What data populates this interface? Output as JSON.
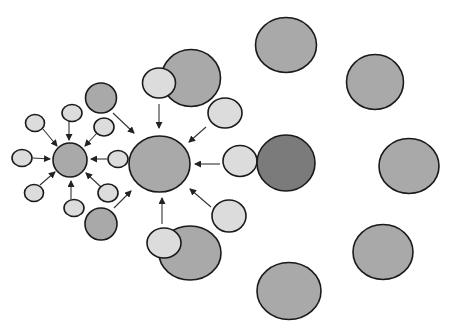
{
  "colors": {
    "light": "#dcdcdc",
    "medium": "#a9a9a9",
    "dark": "#7b7b7b",
    "stroke": "#1a1a1a",
    "arrow": "#333333"
  },
  "nodes": [
    {
      "id": "hub-small",
      "cx": 70,
      "cy": 160,
      "rx": 17,
      "ry": 17,
      "fill": "medium"
    },
    {
      "id": "s-left",
      "cx": 22,
      "cy": 158,
      "rx": 10,
      "ry": 8.5,
      "fill": "light"
    },
    {
      "id": "s-topleft",
      "cx": 35,
      "cy": 123,
      "rx": 9.5,
      "ry": 8.5,
      "fill": "light"
    },
    {
      "id": "s-top",
      "cx": 72,
      "cy": 113,
      "rx": 10,
      "ry": 8.5,
      "fill": "light"
    },
    {
      "id": "s-topright",
      "cx": 104,
      "cy": 127,
      "rx": 10,
      "ry": 9,
      "fill": "light"
    },
    {
      "id": "s-right",
      "cx": 118,
      "cy": 159,
      "rx": 10,
      "ry": 8.5,
      "fill": "light"
    },
    {
      "id": "s-botright",
      "cx": 108,
      "cy": 193,
      "rx": 10,
      "ry": 9,
      "fill": "light"
    },
    {
      "id": "s-bot",
      "cx": 74,
      "cy": 208,
      "rx": 10,
      "ry": 8.5,
      "fill": "light"
    },
    {
      "id": "s-botleft",
      "cx": 34,
      "cy": 193,
      "rx": 9.5,
      "ry": 8.5,
      "fill": "light"
    },
    {
      "id": "m-top",
      "cx": 101,
      "cy": 98,
      "rx": 15.5,
      "ry": 15,
      "fill": "medium"
    },
    {
      "id": "m-bot",
      "cx": 101,
      "cy": 224,
      "rx": 16,
      "ry": 16,
      "fill": "medium"
    },
    {
      "id": "hub-main",
      "cx": 159.5,
      "cy": 164,
      "rx": 30.5,
      "ry": 28,
      "fill": "medium"
    },
    {
      "id": "big-top",
      "cx": 191,
      "cy": 78,
      "rx": 29.5,
      "ry": 28.5,
      "fill": "medium"
    },
    {
      "id": "big-top-light",
      "cx": 159,
      "cy": 83,
      "rx": 16.5,
      "ry": 15,
      "fill": "light"
    },
    {
      "id": "l-topright",
      "cx": 225,
      "cy": 113,
      "rx": 17,
      "ry": 15,
      "fill": "light"
    },
    {
      "id": "l-right",
      "cx": 240,
      "cy": 161,
      "rx": 17,
      "ry": 15.5,
      "fill": "light"
    },
    {
      "id": "dark-right",
      "cx": 286,
      "cy": 163,
      "rx": 29,
      "ry": 28,
      "fill": "dark"
    },
    {
      "id": "l-botright",
      "cx": 229,
      "cy": 216,
      "rx": 17,
      "ry": 16,
      "fill": "light"
    },
    {
      "id": "big-bot",
      "cx": 190,
      "cy": 253,
      "rx": 31,
      "ry": 27,
      "fill": "medium"
    },
    {
      "id": "big-bot-light",
      "cx": 164,
      "cy": 243,
      "rx": 17,
      "ry": 15,
      "fill": "light"
    },
    {
      "id": "r-top",
      "cx": 286,
      "cy": 45,
      "rx": 30.5,
      "ry": 27.5,
      "fill": "medium"
    },
    {
      "id": "r-topright",
      "cx": 375,
      "cy": 82,
      "rx": 28.5,
      "ry": 27.5,
      "fill": "medium"
    },
    {
      "id": "r-right",
      "cx": 409,
      "cy": 166,
      "rx": 30,
      "ry": 27.5,
      "fill": "medium"
    },
    {
      "id": "r-botright",
      "cx": 383,
      "cy": 252,
      "rx": 30,
      "ry": 27.5,
      "fill": "medium"
    },
    {
      "id": "r-bot",
      "cx": 289,
      "cy": 291,
      "rx": 32,
      "ry": 28.5,
      "fill": "medium"
    }
  ],
  "arrows": [
    {
      "x1": 33,
      "y1": 158,
      "x2": 50,
      "y2": 159
    },
    {
      "x1": 43,
      "y1": 129,
      "x2": 57,
      "y2": 146
    },
    {
      "x1": 69,
      "y1": 122,
      "x2": 69,
      "y2": 140
    },
    {
      "x1": 97,
      "y1": 133,
      "x2": 85,
      "y2": 146
    },
    {
      "x1": 107,
      "y1": 159,
      "x2": 91,
      "y2": 159
    },
    {
      "x1": 101,
      "y1": 187,
      "x2": 86,
      "y2": 173
    },
    {
      "x1": 71,
      "y1": 199,
      "x2": 71,
      "y2": 181
    },
    {
      "x1": 40,
      "y1": 185,
      "x2": 55,
      "y2": 172
    },
    {
      "x1": 113,
      "y1": 113,
      "x2": 134,
      "y2": 133
    },
    {
      "x1": 114,
      "y1": 208,
      "x2": 131,
      "y2": 191
    },
    {
      "x1": 159,
      "y1": 104,
      "x2": 159,
      "y2": 128
    },
    {
      "x1": 206,
      "y1": 127,
      "x2": 189,
      "y2": 142
    },
    {
      "x1": 220,
      "y1": 164,
      "x2": 195,
      "y2": 164
    },
    {
      "x1": 211,
      "y1": 207,
      "x2": 190,
      "y2": 189
    },
    {
      "x1": 162,
      "y1": 224,
      "x2": 162,
      "y2": 198
    }
  ]
}
